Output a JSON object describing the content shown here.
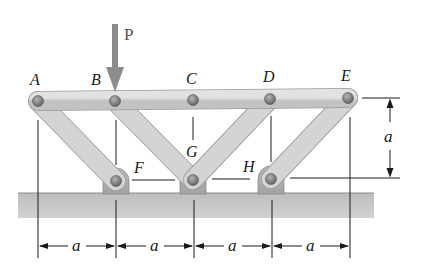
{
  "figure": {
    "type": "truss-diagram",
    "load": {
      "label": "P",
      "joint": "B",
      "direction": "down",
      "color": "#8c8c8c"
    },
    "joints": [
      {
        "id": "A",
        "label": "A",
        "x": 38,
        "y": 101
      },
      {
        "id": "B",
        "label": "B",
        "x": 115,
        "y": 101
      },
      {
        "id": "C",
        "label": "C",
        "x": 193,
        "y": 100
      },
      {
        "id": "D",
        "label": "D",
        "x": 270,
        "y": 99
      },
      {
        "id": "E",
        "label": "E",
        "x": 348,
        "y": 98
      },
      {
        "id": "F",
        "label": "F",
        "x": 116,
        "y": 181
      },
      {
        "id": "G",
        "label": "G",
        "x": 193,
        "y": 180
      },
      {
        "id": "H",
        "label": "H",
        "x": 271,
        "y": 179
      }
    ],
    "members": [
      [
        "A",
        "E"
      ],
      [
        "A",
        "F"
      ],
      [
        "B",
        "G"
      ],
      [
        "D",
        "G"
      ],
      [
        "E",
        "H"
      ]
    ],
    "supports": [
      "F",
      "G",
      "H"
    ],
    "dimensions": {
      "horizontal": [
        "a",
        "a",
        "a",
        "a"
      ],
      "vertical": "a"
    },
    "colors": {
      "member_fill": "#d2d2d2",
      "member_stroke": "#9a9a9a",
      "pin": "#7a7a7a",
      "ground": "#c4c4c4",
      "line": "#1a1a1a"
    }
  }
}
